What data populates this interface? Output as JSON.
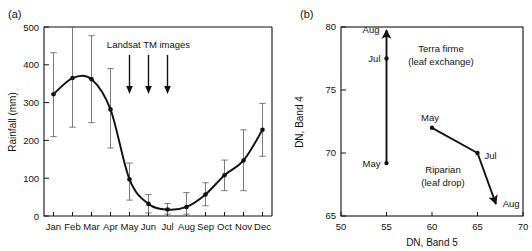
{
  "figure": {
    "panel_a": {
      "label": "(a)",
      "chart_data": {
        "type": "line",
        "title": "",
        "xlabel": "",
        "ylabel": "Rainfall (mm)",
        "categories": [
          "Jan",
          "Feb",
          "Mar",
          "Apr",
          "May",
          "Jun",
          "Jul",
          "Aug",
          "Sep",
          "Oct",
          "Nov",
          "Dec"
        ],
        "values": [
          322,
          365,
          362,
          282,
          97,
          32,
          17,
          24,
          57,
          108,
          147,
          228
        ],
        "error_low": [
          210,
          235,
          247,
          180,
          42,
          8,
          5,
          5,
          27,
          67,
          67,
          158
        ],
        "error_high": [
          432,
          500,
          477,
          390,
          140,
          57,
          33,
          62,
          88,
          148,
          228,
          298
        ],
        "ylim": [
          0,
          500
        ],
        "yticks": [
          0,
          100,
          200,
          300,
          400,
          500
        ],
        "grid": false,
        "legend": "none",
        "annotation": {
          "text": "Landsat TM images",
          "arrow_categories": [
            "May",
            "Jun",
            "Jul"
          ]
        }
      }
    },
    "panel_b": {
      "label": "(b)",
      "chart_data": {
        "type": "scatter",
        "title": "",
        "xlabel": "DN, Band 5",
        "ylabel": "DN, Band 4",
        "xlim": [
          50,
          70
        ],
        "ylim": [
          65,
          80
        ],
        "xticks": [
          50,
          55,
          60,
          65,
          70
        ],
        "yticks": [
          65,
          70,
          75,
          80
        ],
        "grid": false,
        "legend": "none",
        "series": [
          {
            "name": "Terra firme (leaf exchange)",
            "annotation_lines": [
              "Terra firme",
              "(leaf exchange)"
            ],
            "points": [
              {
                "label": "May",
                "x": 55,
                "y": 69.2
              },
              {
                "label": "Jul",
                "x": 55,
                "y": 77.5
              },
              {
                "label": "Aug",
                "x": 55,
                "y": 79.7
              }
            ]
          },
          {
            "name": "Riparian (leaf drop)",
            "annotation_lines": [
              "Riparian",
              "(leaf drop)"
            ],
            "points": [
              {
                "label": "May",
                "x": 60,
                "y": 72.0
              },
              {
                "label": "Jul",
                "x": 65,
                "y": 70.0
              },
              {
                "label": "Aug",
                "x": 67,
                "y": 66.0
              }
            ]
          }
        ]
      }
    }
  },
  "colors": {
    "ink": "#111111",
    "errorbar": "#6b6b6b",
    "background": "#ffffff"
  }
}
